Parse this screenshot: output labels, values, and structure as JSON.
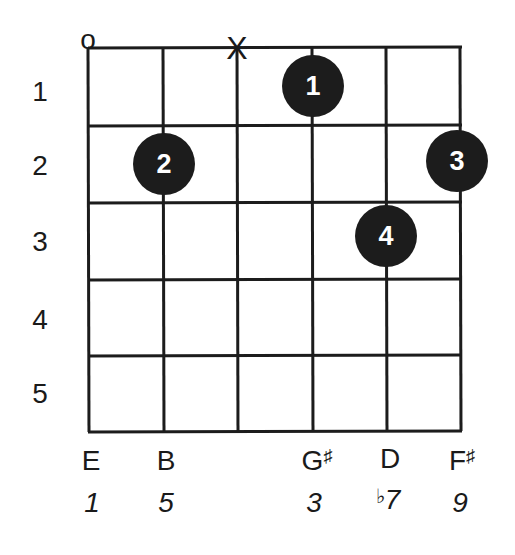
{
  "diagram": {
    "type": "guitar-chord-diagram",
    "fret_numbers": [
      "1",
      "2",
      "3",
      "4",
      "5"
    ],
    "open_marker": "o",
    "muted_marker": "X",
    "strings": [
      {
        "index": 0,
        "marker": "open",
        "note": "E",
        "accidental": "",
        "degree": "1",
        "degree_prefix": ""
      },
      {
        "index": 1,
        "marker": "",
        "note": "B",
        "accidental": "",
        "degree": "5",
        "degree_prefix": ""
      },
      {
        "index": 2,
        "marker": "muted",
        "note": "",
        "accidental": "",
        "degree": "",
        "degree_prefix": ""
      },
      {
        "index": 3,
        "marker": "",
        "note": "G",
        "accidental": "♯",
        "degree": "3",
        "degree_prefix": ""
      },
      {
        "index": 4,
        "marker": "",
        "note": "D",
        "accidental": "",
        "degree": "7",
        "degree_prefix": "♭"
      },
      {
        "index": 5,
        "marker": "",
        "note": "F",
        "accidental": "♯",
        "degree": "9",
        "degree_prefix": ""
      }
    ],
    "fingers": [
      {
        "finger": "1",
        "string": 3,
        "fret": 1
      },
      {
        "finger": "2",
        "string": 1,
        "fret": 2
      },
      {
        "finger": "3",
        "string": 5,
        "fret": 2
      },
      {
        "finger": "4",
        "string": 4,
        "fret": 3
      }
    ],
    "colors": {
      "ink": "#1c1c1c",
      "background": "#ffffff",
      "finger_text": "#ffffff"
    }
  }
}
